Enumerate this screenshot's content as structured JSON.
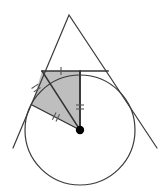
{
  "figure": {
    "width": 168,
    "height": 195,
    "background_color": "#ffffff",
    "stroke_color": "#3a3a3a",
    "shade_fill_color": "#b3b3b3",
    "shade_stroke_color": "#333333",
    "tick_color": "#555555",
    "point_color": "#000000"
  },
  "circle": {
    "name": "inscribed-circle",
    "cx": 80,
    "cy": 130,
    "r": 55,
    "stroke_width": 1.2
  },
  "center_point": {
    "name": "circle-center-point",
    "cx": 80,
    "cy": 130,
    "r": 4.2
  },
  "triangle": {
    "apex": {
      "x": 69,
      "y": 15
    },
    "left_tangent_end": {
      "x": 13,
      "y": 148
    },
    "right_tangent_end": {
      "x": 157,
      "y": 148
    },
    "stroke_width": 1.2
  },
  "horizontal_tangent": {
    "name": "top-tangent-line",
    "x1": 42,
    "y1": 71,
    "x2": 108,
    "y2": 71,
    "stroke_width": 1.6
  },
  "shaded_region": {
    "name": "shaded-kite",
    "points": "42,71 80,71 80,130 32,105",
    "opacity": 0.85
  },
  "radii": [
    {
      "name": "radius-vertical",
      "x1": 80,
      "y1": 71,
      "x2": 80,
      "y2": 130,
      "stroke_width": 1.9
    },
    {
      "name": "radius-to-left-tangent-point",
      "x1": 80,
      "y1": 130,
      "x2": 32,
      "y2": 105,
      "stroke_width": 1.4
    },
    {
      "name": "radius-to-top-left-vertex",
      "x1": 80,
      "y1": 130,
      "x2": 42,
      "y2": 71,
      "stroke_width": 1.4
    }
  ],
  "tick_marks": [
    {
      "name": "tick-single-on-top-tangent",
      "type": "single",
      "cx": 61,
      "cy": 71,
      "angle": 0
    },
    {
      "name": "tick-double-on-vertical-radius",
      "type": "double",
      "cx": 80,
      "cy": 107,
      "angle": 90
    },
    {
      "name": "tick-double-on-left-radius",
      "type": "double",
      "cx": 56,
      "cy": 117,
      "angle": 27
    },
    {
      "name": "tick-double-on-upper-left-radius",
      "type": "double",
      "cx": 36,
      "cy": 88,
      "angle": 57
    }
  ]
}
